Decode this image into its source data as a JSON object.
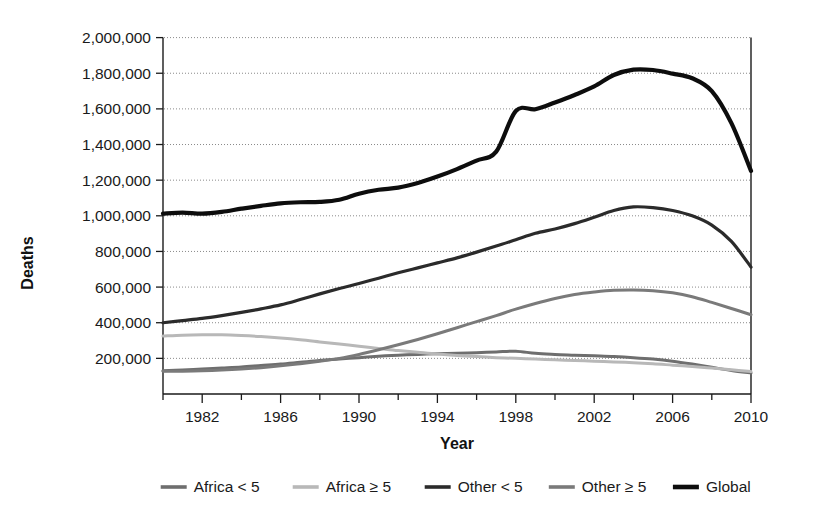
{
  "chart_data": {
    "type": "line",
    "title": "",
    "xlabel": "Year",
    "ylabel": "Deaths",
    "xlim": [
      1980,
      2010
    ],
    "ylim": [
      0,
      2000000
    ],
    "grid": true,
    "legend_position": "bottom",
    "x": [
      1980,
      1981,
      1982,
      1983,
      1984,
      1985,
      1986,
      1987,
      1988,
      1989,
      1990,
      1991,
      1992,
      1993,
      1994,
      1995,
      1996,
      1997,
      1998,
      1999,
      2000,
      2001,
      2002,
      2003,
      2004,
      2005,
      2006,
      2007,
      2008,
      2009,
      2010
    ],
    "x_tick_labels": [
      "1982",
      "1986",
      "1990",
      "1994",
      "1998",
      "2002",
      "2006",
      "2010"
    ],
    "x_tick_values": [
      1982,
      1986,
      1990,
      1994,
      1998,
      2002,
      2006,
      2010
    ],
    "x_minor_tick_values": [
      1980,
      1982,
      1984,
      1986,
      1988,
      1990,
      1992,
      1994,
      1996,
      1998,
      2000,
      2002,
      2004,
      2006,
      2008,
      2010
    ],
    "y_tick_labels": [
      "200,000",
      "400,000",
      "600,000",
      "800,000",
      "1,000,000",
      "1,200,000",
      "1,400,000",
      "1,600,000",
      "1,800,000",
      "2,000,000"
    ],
    "y_tick_values": [
      200000,
      400000,
      600000,
      800000,
      1000000,
      1200000,
      1400000,
      1600000,
      1800000,
      2000000
    ],
    "series": [
      {
        "name": "Africa < 5",
        "color": "#6e6e6e",
        "width": 3.0,
        "values": [
          130000,
          135000,
          140000,
          146000,
          152000,
          160000,
          168000,
          178000,
          188000,
          196000,
          204000,
          212000,
          218000,
          222000,
          226000,
          228000,
          232000,
          236000,
          240000,
          228000,
          222000,
          218000,
          214000,
          210000,
          204000,
          196000,
          184000,
          168000,
          150000,
          132000,
          118000
        ]
      },
      {
        "name": "Africa ≥ 5",
        "color": "#b8b8b8",
        "width": 3.0,
        "values": [
          325000,
          330000,
          332000,
          332000,
          328000,
          322000,
          314000,
          304000,
          292000,
          280000,
          268000,
          256000,
          244000,
          234000,
          224000,
          216000,
          210000,
          204000,
          200000,
          196000,
          192000,
          188000,
          184000,
          180000,
          176000,
          170000,
          162000,
          154000,
          146000,
          136000,
          126000
        ]
      },
      {
        "name": "Other < 5",
        "color": "#2b2b2b",
        "width": 3.2,
        "values": [
          400000,
          412000,
          424000,
          440000,
          458000,
          478000,
          500000,
          530000,
          562000,
          592000,
          620000,
          650000,
          680000,
          708000,
          736000,
          764000,
          796000,
          830000,
          866000,
          902000,
          926000,
          956000,
          992000,
          1030000,
          1050000,
          1046000,
          1030000,
          1000000,
          948000,
          856000,
          712000
        ]
      },
      {
        "name": "Other ≥ 5",
        "color": "#7a7a7a",
        "width": 3.0,
        "values": [
          128000,
          128000,
          130000,
          134000,
          140000,
          148000,
          158000,
          170000,
          184000,
          200000,
          222000,
          248000,
          276000,
          306000,
          338000,
          372000,
          406000,
          440000,
          476000,
          508000,
          536000,
          558000,
          572000,
          582000,
          584000,
          580000,
          568000,
          546000,
          514000,
          480000,
          445000
        ]
      },
      {
        "name": "Global",
        "color": "#0d0d0d",
        "width": 4.2,
        "values": [
          1012000,
          1018000,
          1012000,
          1022000,
          1040000,
          1056000,
          1070000,
          1076000,
          1078000,
          1090000,
          1124000,
          1146000,
          1158000,
          1184000,
          1220000,
          1262000,
          1310000,
          1360000,
          1588000,
          1598000,
          1636000,
          1678000,
          1726000,
          1790000,
          1820000,
          1818000,
          1798000,
          1772000,
          1700000,
          1520000,
          1252000
        ]
      }
    ]
  },
  "legend": {
    "items": [
      {
        "label": "Africa < 5",
        "color": "#6e6e6e"
      },
      {
        "label": "Africa ≥ 5",
        "color": "#b8b8b8"
      },
      {
        "label": "Other < 5",
        "color": "#2b2b2b"
      },
      {
        "label": "Other ≥ 5",
        "color": "#7a7a7a"
      },
      {
        "label": "Global",
        "color": "#0d0d0d"
      }
    ]
  },
  "axes": {
    "x_title": "Year",
    "y_title": "Deaths"
  }
}
